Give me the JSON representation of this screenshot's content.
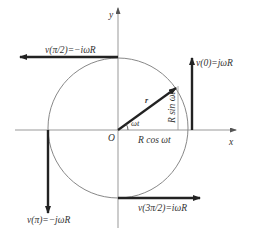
{
  "diagram": {
    "title": "",
    "axes": {
      "x_label": "x",
      "y_label": "y",
      "origin_label": "O"
    },
    "angle_label": "ωt",
    "radius_vector_label": "r",
    "projection_labels": {
      "horizontal": "R cos ωt",
      "vertical": "R sin ωt"
    },
    "velocity_vectors": [
      {
        "id": "v0",
        "label": "v(0)=jωR",
        "direction": "up",
        "position": "right"
      },
      {
        "id": "v_pi_2",
        "label": "v(π/2)=−iωR",
        "direction": "left",
        "position": "top"
      },
      {
        "id": "v_pi",
        "label": "v(π)=−jωR",
        "direction": "down",
        "position": "left"
      },
      {
        "id": "v_3pi_2",
        "label": "v(3π/2)=iωR",
        "direction": "right",
        "position": "bottom"
      }
    ],
    "colors": {
      "circle": "#888888",
      "axes": "#999999",
      "vector": "#222222",
      "text": "#333333"
    }
  }
}
